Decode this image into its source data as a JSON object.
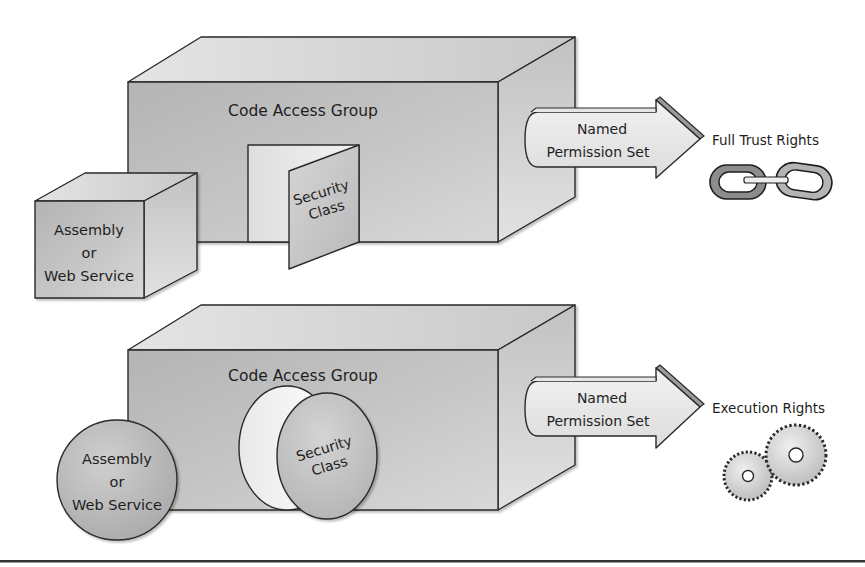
{
  "diagram": {
    "colors": {
      "background": "#ffffff",
      "front_face": "#bdbdbd",
      "top_face": "#d9d9d9",
      "side_face": "#cccccc",
      "outline": "#2a2a2a",
      "text": "#1e1e1e",
      "divider": "#333333"
    },
    "top_scenario": {
      "group_label": "Code Access Group",
      "assembly_shape": "cube",
      "assembly_label": [
        "Assembly",
        "or",
        "Web Service"
      ],
      "security_shape": "door",
      "security_label": [
        "Security",
        "Class"
      ],
      "arrow_label": [
        "Named",
        "Permission Set"
      ],
      "rights_label": "Full Trust Rights",
      "rights_icon": "chain-link-icon"
    },
    "bottom_scenario": {
      "group_label": "Code Access Group",
      "assembly_shape": "sphere",
      "assembly_label": [
        "Assembly",
        "or",
        "Web Service"
      ],
      "security_shape": "disc",
      "security_label": [
        "Security",
        "Class"
      ],
      "arrow_label": [
        "Named",
        "Permission Set"
      ],
      "rights_label": "Execution Rights",
      "rights_icon": "gears-icon"
    }
  }
}
